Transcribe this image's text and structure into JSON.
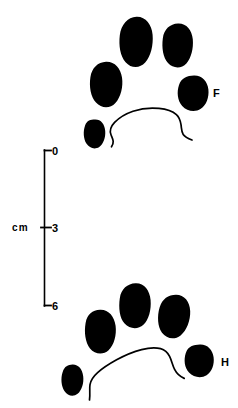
{
  "figure": {
    "name": "animal-track-illustration",
    "background_color": "#ffffff",
    "ink_color": "#000000",
    "width": 238,
    "height": 408
  },
  "scale_bar": {
    "unit_label": "cm",
    "orientation": "vertical",
    "ticks": [
      {
        "label": "0",
        "value": 0,
        "y": 150
      },
      {
        "label": "3",
        "value": 3,
        "y": 227
      },
      {
        "label": "6",
        "value": 6,
        "y": 306
      }
    ],
    "range": [
      0,
      6
    ],
    "axis_x": 44,
    "unit_label_x": 12,
    "unit_label_y": 231
  },
  "prints": [
    {
      "id": "front-print",
      "label": "F",
      "label_meaning": "Front foot",
      "label_x": 213,
      "label_y": 93,
      "pads": [
        {
          "name": "toe-pad-top-center",
          "cx": 136,
          "cy": 42
        },
        {
          "name": "toe-pad-top-right",
          "cx": 177,
          "cy": 46
        },
        {
          "name": "toe-pad-left",
          "cx": 106,
          "cy": 85
        },
        {
          "name": "toe-pad-right",
          "cx": 193,
          "cy": 93
        },
        {
          "name": "toe-pad-lower-left",
          "cx": 94,
          "cy": 134
        }
      ],
      "heel": {
        "name": "heel-arc"
      }
    },
    {
      "id": "hind-print",
      "label": "H",
      "label_meaning": "Hind foot",
      "label_x": 221,
      "label_y": 362,
      "pads": [
        {
          "name": "toe-pad-top-center",
          "cx": 135,
          "cy": 305
        },
        {
          "name": "toe-pad-top-right",
          "cx": 174,
          "cy": 316
        },
        {
          "name": "toe-pad-left",
          "cx": 100,
          "cy": 331
        },
        {
          "name": "toe-pad-right",
          "cx": 200,
          "cy": 361
        },
        {
          "name": "toe-pad-lower-left",
          "cx": 72,
          "cy": 381
        }
      ],
      "heel": {
        "name": "heel-arc"
      }
    }
  ]
}
